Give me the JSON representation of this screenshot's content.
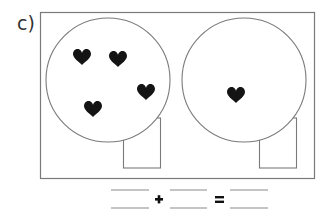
{
  "exercise": {
    "label": "c)",
    "groups": [
      {
        "name": "left-circle",
        "heart_count": 4
      },
      {
        "name": "right-circle",
        "heart_count": 1
      }
    ],
    "equation": {
      "plus_symbol": "+",
      "equals_symbol": "=",
      "blanks": [
        "",
        "",
        ""
      ]
    }
  }
}
